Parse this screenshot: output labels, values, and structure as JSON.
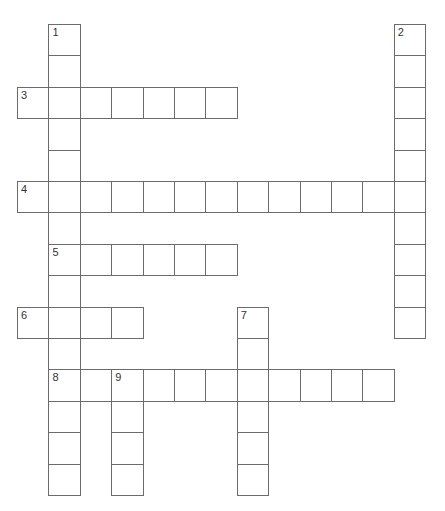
{
  "puzzle": {
    "cell_size": 31.4,
    "origin_x": 17,
    "origin_y": 24,
    "clues": [
      {
        "number": "1",
        "direction": "down",
        "row": 0,
        "col": 1,
        "length": 15
      },
      {
        "number": "2",
        "direction": "down",
        "row": 0,
        "col": 12,
        "length": 10
      },
      {
        "number": "3",
        "direction": "across",
        "row": 2,
        "col": 0,
        "length": 7
      },
      {
        "number": "4",
        "direction": "across",
        "row": 5,
        "col": 0,
        "length": 13
      },
      {
        "number": "5",
        "direction": "across",
        "row": 7,
        "col": 1,
        "length": 6
      },
      {
        "number": "6",
        "direction": "across",
        "row": 9,
        "col": 0,
        "length": 4
      },
      {
        "number": "7",
        "direction": "down",
        "row": 9,
        "col": 7,
        "length": 6
      },
      {
        "number": "8",
        "direction": "across",
        "row": 11,
        "col": 1,
        "length": 11
      },
      {
        "number": "9",
        "direction": "down",
        "row": 11,
        "col": 3,
        "length": 4
      }
    ]
  }
}
